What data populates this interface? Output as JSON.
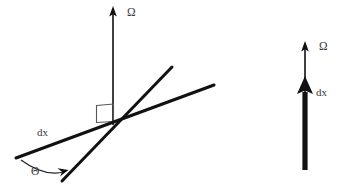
{
  "figure": {
    "background_color": "#ffffff",
    "line_color": "#111111",
    "label_color": "#3a3a3a",
    "panels": [
      {
        "id": "oblique-panel",
        "name": "oblique-case",
        "description": "Vertical rotation axis Omega with a line element dx crossing it at an angle Theta",
        "labels": {
          "omega": "Ω",
          "dx": "dx",
          "theta": "Θ"
        },
        "elements": {
          "omega_axis": "vertical-arrow",
          "dx_line": "shallow-slanted-line",
          "second_line": "steep-slanted-line",
          "right_angle": "right-angle-marker",
          "theta_arc": "angle-arc-with-arrowhead"
        }
      },
      {
        "id": "parallel-panel",
        "name": "parallel-case",
        "description": "Rotation axis Omega and line element dx both pointing vertically upward",
        "labels": {
          "omega": "Ω",
          "dx": "dx"
        },
        "elements": {
          "omega_axis": "thin-vertical-arrow",
          "dx_vector": "thick-vertical-arrow"
        }
      }
    ]
  }
}
